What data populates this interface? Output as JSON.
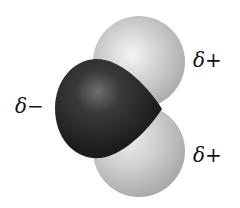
{
  "figure": {
    "title": "",
    "atoms": [
      {
        "name": "oxygen",
        "color": "#222222",
        "highlight": "#6a6a6a"
      },
      {
        "name": "hydrogen-top",
        "color": "#b9b9b9",
        "highlight": "#f2f2f2"
      },
      {
        "name": "hydrogen-bottom",
        "color": "#b9b9b9",
        "highlight": "#eeeeee"
      }
    ],
    "labels": {
      "oxygen_charge_symbol": "δ",
      "oxygen_charge_sign": "−",
      "hydrogen_top_symbol": "δ",
      "hydrogen_top_sign": "+",
      "hydrogen_bottom_symbol": "δ",
      "hydrogen_bottom_sign": "+"
    }
  }
}
